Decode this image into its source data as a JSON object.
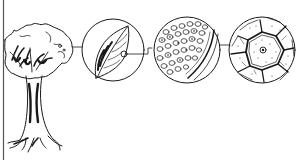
{
  "diagram": {
    "type": "levels-of-organization-illustration",
    "style": "black ink line drawing on white",
    "colors": {
      "ink": "#1a1a1a",
      "background": "#ffffff",
      "frame": "#555555"
    },
    "panels": [
      {
        "id": "organism",
        "subject": "tree",
        "shape": "freeform"
      },
      {
        "id": "organ",
        "subject": "leaf",
        "shape": "circle"
      },
      {
        "id": "tissue",
        "subject": "leaf tissue cross-section",
        "shape": "circle"
      },
      {
        "id": "cell",
        "subject": "plant cell",
        "shape": "circle"
      }
    ],
    "connectors": [
      {
        "from": "organism",
        "to": "organ"
      },
      {
        "from": "organ",
        "to": "tissue"
      },
      {
        "from": "tissue",
        "to": "cell"
      }
    ]
  }
}
